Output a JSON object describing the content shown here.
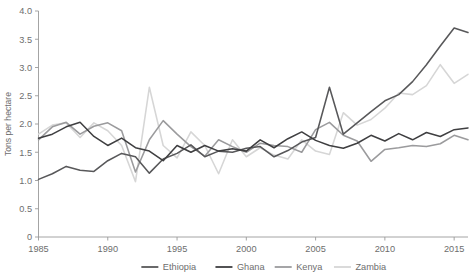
{
  "chart_data": {
    "type": "line",
    "title": "",
    "xlabel": "",
    "ylabel": "Tons per hectare",
    "xlim": [
      1985,
      2016
    ],
    "ylim": [
      0,
      4.0
    ],
    "grid": false,
    "legend_position": "bottom",
    "x_tick_labels": [
      "1985",
      "1990",
      "1995",
      "2000",
      "2005",
      "2010",
      "2015"
    ],
    "x_ticks": [
      1985,
      1990,
      1995,
      2000,
      2005,
      2010,
      2015
    ],
    "y_tick_labels": [
      "0",
      "0.5",
      "1.0",
      "1.5",
      "2.0",
      "2.5",
      "3.0",
      "3.5",
      "4.0"
    ],
    "y_ticks": [
      0,
      0.5,
      1.0,
      1.5,
      2.0,
      2.5,
      3.0,
      3.5,
      4.0
    ],
    "x": [
      1985,
      1986,
      1987,
      1988,
      1989,
      1990,
      1991,
      1992,
      1993,
      1994,
      1995,
      1996,
      1997,
      1998,
      1999,
      2000,
      2001,
      2002,
      2003,
      2004,
      2005,
      2006,
      2007,
      2008,
      2009,
      2010,
      2011,
      2012,
      2013,
      2014,
      2015,
      2016
    ],
    "series": [
      {
        "name": "Ethiopia",
        "color": "#58585a",
        "values": [
          1.02,
          1.12,
          1.25,
          1.18,
          1.16,
          1.35,
          1.48,
          1.42,
          1.13,
          1.38,
          1.48,
          1.63,
          1.42,
          1.52,
          1.5,
          1.57,
          1.6,
          1.42,
          1.53,
          1.68,
          1.76,
          2.65,
          1.82,
          2.02,
          2.22,
          2.41,
          2.52,
          2.75,
          3.05,
          3.38,
          3.7,
          3.62
        ]
      },
      {
        "name": "Ghana",
        "color": "#3f3f41",
        "values": [
          1.75,
          1.82,
          1.95,
          2.03,
          1.78,
          1.62,
          1.75,
          1.58,
          1.52,
          1.35,
          1.62,
          1.5,
          1.62,
          1.52,
          1.56,
          1.52,
          1.72,
          1.58,
          1.74,
          1.86,
          1.71,
          1.62,
          1.57,
          1.66,
          1.8,
          1.7,
          1.83,
          1.72,
          1.85,
          1.78,
          1.9,
          1.93
        ]
      },
      {
        "name": "Kenya",
        "color": "#9b9b9d",
        "values": [
          1.72,
          1.95,
          2.03,
          1.82,
          1.96,
          2.02,
          1.88,
          1.15,
          1.72,
          2.06,
          1.82,
          1.6,
          1.43,
          1.72,
          1.6,
          1.5,
          1.66,
          1.62,
          1.6,
          1.5,
          1.9,
          2.03,
          1.8,
          1.7,
          1.34,
          1.55,
          1.58,
          1.62,
          1.6,
          1.65,
          1.8,
          1.72
        ]
      },
      {
        "name": "Zambia",
        "color": "#d6d6d6",
        "values": [
          1.82,
          1.98,
          2.02,
          1.76,
          2.02,
          1.88,
          1.62,
          0.98,
          2.65,
          1.62,
          1.4,
          1.86,
          1.62,
          1.12,
          1.72,
          1.42,
          1.58,
          1.45,
          1.38,
          1.72,
          1.52,
          1.46,
          2.2,
          1.98,
          2.08,
          2.28,
          2.55,
          2.52,
          2.68,
          3.05,
          2.72,
          2.88
        ]
      }
    ]
  },
  "axis": {
    "y_axis_title": "Tons per hectare"
  },
  "legend": {
    "items": [
      {
        "label": "Ethiopia",
        "color": "#58585a"
      },
      {
        "label": "Ghana",
        "color": "#3f3f41"
      },
      {
        "label": "Kenya",
        "color": "#9b9b9d"
      },
      {
        "label": "Zambia",
        "color": "#d6d6d6"
      }
    ]
  }
}
